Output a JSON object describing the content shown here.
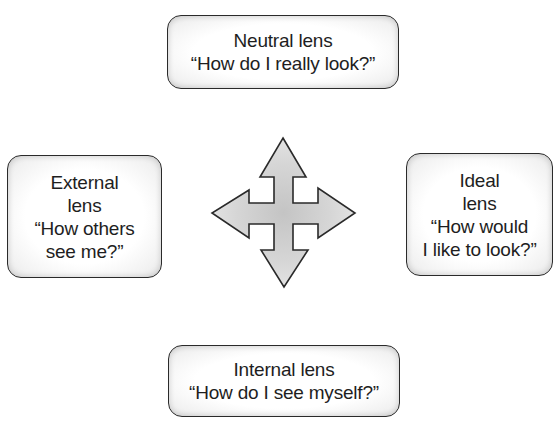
{
  "diagram": {
    "center_icon": "four-way-arrow-icon",
    "colors": {
      "border": "#2a2a2a",
      "arrow_fill": "#d4d4d4",
      "box_fill": "#ffffff",
      "text": "#1e1e1e"
    },
    "lenses": {
      "neutral": {
        "title": "Neutral lens",
        "question": "“How do I really look?”"
      },
      "external": {
        "line1": "External",
        "line2": "lens",
        "line3": "“How others",
        "line4": "see me?”"
      },
      "ideal": {
        "line1": "Ideal",
        "line2": "lens",
        "line3": "“How would",
        "line4": "I like to look?”"
      },
      "internal": {
        "title": "Internal lens",
        "question": "“How do I see myself?”"
      }
    }
  }
}
